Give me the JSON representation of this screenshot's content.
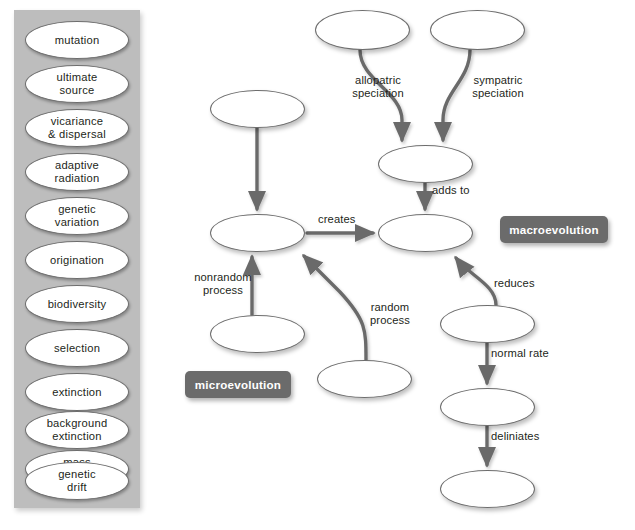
{
  "word_bank": {
    "name": "word-bank",
    "background_color": "#bdbdbd",
    "items": [
      {
        "label": "mutation",
        "x": 11,
        "y": 11,
        "w": 104,
        "h": 38
      },
      {
        "label": "ultimate\nsource",
        "x": 11,
        "y": 55,
        "w": 104,
        "h": 38
      },
      {
        "label": "vicariance\n& dispersal",
        "x": 11,
        "y": 99,
        "w": 104,
        "h": 38
      },
      {
        "label": "adaptive\nradiation",
        "x": 11,
        "y": 143,
        "w": 104,
        "h": 38
      },
      {
        "label": "genetic\nvariation",
        "x": 11,
        "y": 187,
        "w": 104,
        "h": 38
      },
      {
        "label": "origination",
        "x": 11,
        "y": 231,
        "w": 104,
        "h": 38
      },
      {
        "label": "biodiversity",
        "x": 11,
        "y": 275,
        "w": 104,
        "h": 38
      },
      {
        "label": "selection",
        "x": 11,
        "y": 319,
        "w": 104,
        "h": 38
      },
      {
        "label": "extinction",
        "x": 11,
        "y": 363,
        "w": 104,
        "h": 38
      },
      {
        "label": "background\nextinction",
        "x": 11,
        "y": 401,
        "w": 104,
        "h": 38
      },
      {
        "label": "mass\nextinction",
        "x": 11,
        "y": 440,
        "w": 104,
        "h": 38
      },
      {
        "label": "genetic\ndrift",
        "x": 11,
        "y": 452,
        "w": 104,
        "h": 38
      }
    ]
  },
  "diagram": {
    "name": "concept-map",
    "stroke_color": "#6b6b6b",
    "node_fill": "#ffffff",
    "node_stroke": "#6d6d6d",
    "nodes": [
      {
        "id": "n-top-left",
        "label": "",
        "x": 315,
        "y": 10,
        "w": 95,
        "h": 40
      },
      {
        "id": "n-top-right",
        "label": "",
        "x": 430,
        "y": 10,
        "w": 95,
        "h": 40
      },
      {
        "id": "n-mid-left-top",
        "label": "",
        "x": 210,
        "y": 90,
        "w": 95,
        "h": 38
      },
      {
        "id": "n-merge",
        "label": "",
        "x": 378,
        "y": 145,
        "w": 95,
        "h": 38
      },
      {
        "id": "n-micro-core",
        "label": "",
        "x": 210,
        "y": 214,
        "w": 95,
        "h": 38
      },
      {
        "id": "n-macro-core",
        "label": "",
        "x": 378,
        "y": 214,
        "w": 95,
        "h": 38
      },
      {
        "id": "n-nonrandom-src",
        "label": "",
        "x": 210,
        "y": 315,
        "w": 95,
        "h": 38
      },
      {
        "id": "n-random-src",
        "label": "",
        "x": 317,
        "y": 360,
        "w": 95,
        "h": 38
      },
      {
        "id": "n-reduces-src",
        "label": "",
        "x": 440,
        "y": 305,
        "w": 95,
        "h": 38
      },
      {
        "id": "n-rate",
        "label": "",
        "x": 440,
        "y": 388,
        "w": 95,
        "h": 38
      },
      {
        "id": "n-bottom",
        "label": "",
        "x": 440,
        "y": 470,
        "w": 95,
        "h": 38
      }
    ],
    "edge_labels": [
      {
        "text": "allopatric\nspeciation",
        "x": 341,
        "y": 74,
        "w": 74,
        "align": "center"
      },
      {
        "text": "sympatric\nspeciation",
        "x": 461,
        "y": 74,
        "w": 74,
        "align": "center"
      },
      {
        "text": "adds to",
        "x": 432,
        "y": 184,
        "w": 58,
        "align": "left"
      },
      {
        "text": "creates",
        "x": 318,
        "y": 213,
        "w": 54,
        "align": "left"
      },
      {
        "text": "nonrandom\nprocess",
        "x": 186,
        "y": 271,
        "w": 74,
        "align": "center"
      },
      {
        "text": "random\nprocess",
        "x": 359,
        "y": 301,
        "w": 62,
        "align": "center"
      },
      {
        "text": "reduces",
        "x": 494,
        "y": 277,
        "w": 60,
        "align": "left"
      },
      {
        "text": "normal rate",
        "x": 491,
        "y": 347,
        "w": 78,
        "align": "left"
      },
      {
        "text": "deliniates",
        "x": 491,
        "y": 430,
        "w": 70,
        "align": "left"
      }
    ],
    "tags": [
      {
        "text": "macroevolution",
        "x": 500,
        "y": 216,
        "w": 108,
        "h": 27
      },
      {
        "text": "microevolution",
        "x": 185,
        "y": 371,
        "w": 106,
        "h": 27
      }
    ]
  }
}
